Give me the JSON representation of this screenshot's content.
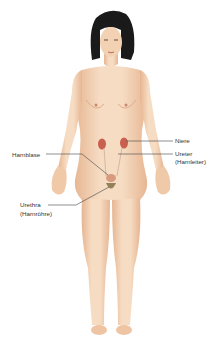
{
  "diagram": {
    "labels": {
      "niere": "Niere",
      "harnblase": "Harnblase",
      "ureter_line1": "Ureter",
      "ureter_line2": "(Harnleiter)",
      "urethra_line1": "Urethra",
      "urethra_line2": "(Harnröhre)"
    },
    "colors": {
      "skin": "#f3d2b4",
      "skin_shadow": "#e4b08a",
      "hair": "#1a1a1a",
      "kidney": "#c9604f",
      "bladder": "#d89a7e",
      "leader_line": "#444444"
    }
  }
}
